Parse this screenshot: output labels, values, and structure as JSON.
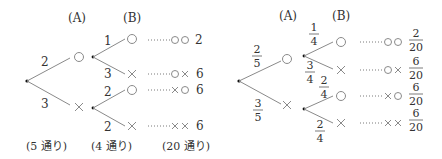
{
  "left_tree": {
    "header_a": "(A)",
    "header_b": "(B)",
    "branch_a_circle": "2",
    "branch_a_cross": "3",
    "branch_b_circle_circle": "1",
    "branch_b_circle_cross": "3",
    "branch_b_cross_circle": "2",
    "branch_b_cross_cross": "2",
    "outcome_values": [
      "2",
      "6",
      "6",
      "6"
    ],
    "footer_a": "(5 通り)",
    "footer_b": "(4 通り)",
    "footer_total": "(20 通り)"
  },
  "right_tree": {
    "header_a": "(A)",
    "header_b": "(B)",
    "frac_a_circle": {
      "num": "2",
      "den": "5"
    },
    "frac_a_cross": {
      "num": "3",
      "den": "5"
    },
    "frac_b_circle_circle": {
      "num": "1",
      "den": "4"
    },
    "frac_b_circle_cross": {
      "num": "3",
      "den": "4"
    },
    "frac_b_cross_circle": {
      "num": "2",
      "den": "4"
    },
    "frac_b_cross_cross": {
      "num": "2",
      "den": "4"
    },
    "outcome_fracs": [
      {
        "num": "2",
        "den": "20"
      },
      {
        "num": "6",
        "den": "20"
      },
      {
        "num": "6",
        "den": "20"
      },
      {
        "num": "6",
        "den": "20"
      }
    ]
  },
  "symbols": {
    "circle": "○",
    "cross": "×"
  }
}
